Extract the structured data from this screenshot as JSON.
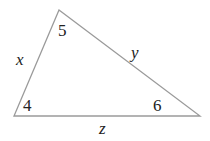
{
  "diagram": {
    "type": "triangle",
    "stroke_color": "#9a9a9a",
    "vertices": {
      "top": [
        59,
        10
      ],
      "bottom_left": [
        14,
        116
      ],
      "bottom_right": [
        200,
        116
      ]
    },
    "angle_labels": {
      "top": "5",
      "bottom_left": "4",
      "bottom_right": "6"
    },
    "side_labels": {
      "left": "x",
      "hypotenuse": "y",
      "bottom": "z"
    }
  }
}
